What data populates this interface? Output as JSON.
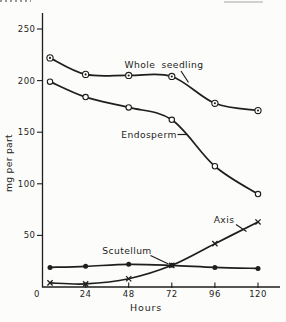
{
  "page": {
    "background": "#fcfcfa",
    "ink": "#1e1e1e"
  },
  "chart_data": {
    "type": "line",
    "title": "",
    "xlabel": "Hours",
    "ylabel": "mg per part",
    "x": [
      0,
      24,
      48,
      72,
      96,
      120
    ],
    "x_tick_labels": [
      "0",
      "24",
      "48",
      "72",
      "96",
      "120"
    ],
    "y_ticks": [
      50,
      100,
      150,
      200,
      250
    ],
    "y_tick_labels": [
      "50",
      "100",
      "150",
      "200",
      "250"
    ],
    "xlim": [
      0,
      132
    ],
    "ylim": [
      0,
      265
    ],
    "grid": false,
    "legend": "inline-labels-with-leader-lines",
    "series": [
      {
        "name": "Whole seedling",
        "marker": "circled-dot",
        "values": [
          222,
          206,
          205,
          204,
          178,
          171
        ]
      },
      {
        "name": "Endosperm",
        "marker": "open-circle",
        "values": [
          199,
          184,
          174,
          162,
          117,
          90
        ]
      },
      {
        "name": "Scutellum",
        "marker": "filled-dot",
        "values": [
          19,
          20,
          22,
          21,
          19,
          18
        ]
      },
      {
        "name": "Axis",
        "marker": "x-cross",
        "values": [
          4,
          3,
          8,
          21,
          42,
          63
        ]
      }
    ]
  }
}
